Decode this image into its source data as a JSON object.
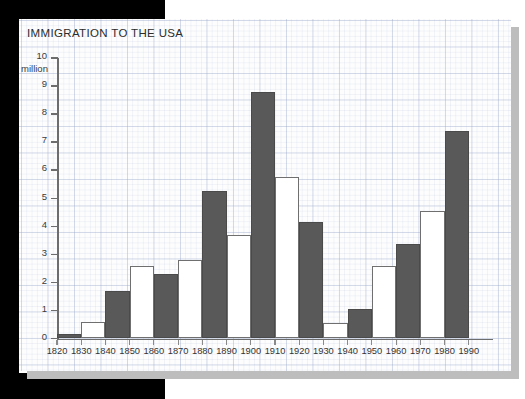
{
  "chart_data": {
    "type": "bar",
    "title": "IMMIGRATION TO THE USA",
    "xlabel": "",
    "ylabel": "million",
    "ylim": [
      0,
      10
    ],
    "y_ticks": [
      0,
      1,
      2,
      3,
      4,
      5,
      6,
      7,
      8,
      9,
      10
    ],
    "unit_label": "million",
    "grid": true,
    "legend": "none",
    "x_tick_labels": [
      "1820",
      "1830",
      "1840",
      "1850",
      "1860",
      "1870",
      "1880",
      "1890",
      "1900",
      "1910",
      "1920",
      "1930",
      "1940",
      "1950",
      "1960",
      "1970",
      "1980",
      "1990"
    ],
    "categories": [
      "1820-1830",
      "1830-1840",
      "1840-1850",
      "1850-1860",
      "1860-1870",
      "1870-1880",
      "1880-1890",
      "1890-1900",
      "1900-1910",
      "1910-1920",
      "1920-1930",
      "1930-1940",
      "1940-1950",
      "1950-1960",
      "1960-1970",
      "1970-1980",
      "1980-1990"
    ],
    "values": [
      0.15,
      0.6,
      1.7,
      2.6,
      2.3,
      2.8,
      5.25,
      3.7,
      8.8,
      5.75,
      4.15,
      0.55,
      1.05,
      2.6,
      3.35,
      4.55,
      7.4
    ],
    "bar_styles": [
      "dark",
      "light",
      "dark",
      "light",
      "dark",
      "light",
      "dark",
      "light",
      "dark",
      "light",
      "dark",
      "light",
      "dark",
      "light",
      "dark",
      "light",
      "dark"
    ],
    "colors": {
      "bar_dark": "#595959",
      "bar_light": "#ffffff",
      "bar_outline": "#6f6f6f",
      "axis": "#6d6d6d",
      "text": "#333333",
      "paper": "#fdfdfd",
      "grid": "#96a5c8",
      "frame": "#000000",
      "shadow": "#bdbdbd"
    }
  }
}
